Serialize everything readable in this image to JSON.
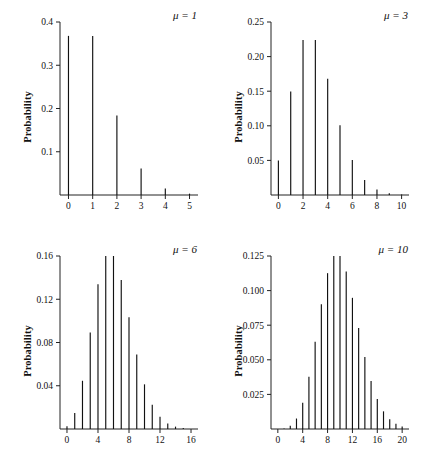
{
  "figure": {
    "title": "",
    "panel_count": 4
  },
  "chart_data": [
    {
      "type": "bar",
      "title": "",
      "annotation": "μ = 1",
      "mu": 1,
      "xlabel": "",
      "ylabel": "Probability",
      "x": [
        0,
        1,
        2,
        3,
        4,
        5
      ],
      "values": [
        0.3679,
        0.3679,
        0.1839,
        0.0613,
        0.0153,
        0.0031
      ],
      "categories": [
        "0",
        "1",
        "2",
        "3",
        "4",
        "5"
      ],
      "xlim": [
        -0.35,
        5.35
      ],
      "ylim": [
        0,
        0.4
      ],
      "xticks": [
        0,
        1,
        2,
        3,
        4,
        5
      ],
      "xticklabels": [
        "0",
        "1",
        "2",
        "3",
        "4",
        "5"
      ],
      "yticks": [
        0.1,
        0.2,
        0.3,
        0.4
      ],
      "yticklabels": [
        "0.1",
        "0.2",
        "0.3",
        "0.4"
      ],
      "grid": false,
      "legend": "none"
    },
    {
      "type": "bar",
      "title": "",
      "annotation": "μ = 3",
      "mu": 3,
      "xlabel": "",
      "ylabel": "Probability",
      "x": [
        0,
        1,
        2,
        3,
        4,
        5,
        6,
        7,
        8,
        9,
        10
      ],
      "values": [
        0.0498,
        0.1494,
        0.224,
        0.224,
        0.168,
        0.1008,
        0.0504,
        0.0216,
        0.0081,
        0.0027,
        0.0008
      ],
      "categories": [
        "0",
        "1",
        "2",
        "3",
        "4",
        "5",
        "6",
        "7",
        "8",
        "9",
        "10"
      ],
      "xlim": [
        -0.6,
        10.6
      ],
      "ylim": [
        0,
        0.25
      ],
      "xticks": [
        0,
        2,
        4,
        6,
        8,
        10
      ],
      "xticklabels": [
        "0",
        "2",
        "4",
        "6",
        "8",
        "10"
      ],
      "yticks": [
        0.05,
        0.1,
        0.15,
        0.2,
        0.25
      ],
      "yticklabels": [
        "0.05",
        "0.10",
        "0.15",
        "0.20",
        "0.25"
      ],
      "grid": false,
      "legend": "none"
    },
    {
      "type": "bar",
      "title": "",
      "annotation": "μ = 6",
      "mu": 6,
      "xlabel": "",
      "ylabel": "Probability",
      "x": [
        0,
        1,
        2,
        3,
        4,
        5,
        6,
        7,
        8,
        9,
        10,
        11,
        12,
        13,
        14,
        15,
        16
      ],
      "values": [
        0.0025,
        0.0149,
        0.0446,
        0.0892,
        0.1339,
        0.1606,
        0.1606,
        0.1377,
        0.1033,
        0.0688,
        0.0413,
        0.0225,
        0.0113,
        0.0052,
        0.0022,
        0.0009,
        0.0003
      ],
      "categories": [
        "0",
        "1",
        "2",
        "3",
        "4",
        "5",
        "6",
        "7",
        "8",
        "9",
        "10",
        "11",
        "12",
        "13",
        "14",
        "15",
        "16"
      ],
      "xlim": [
        -0.9,
        16.9
      ],
      "ylim": [
        0,
        0.16
      ],
      "xticks": [
        0,
        4,
        8,
        12,
        16
      ],
      "xticklabels": [
        "0",
        "4",
        "8",
        "12",
        "16"
      ],
      "yticks": [
        0.04,
        0.08,
        0.12,
        0.16
      ],
      "yticklabels": [
        "0.04",
        "0.08",
        "0.12",
        "0.16"
      ],
      "grid": false,
      "legend": "none"
    },
    {
      "type": "bar",
      "title": "",
      "annotation": "μ = 10",
      "mu": 10,
      "xlabel": "",
      "ylabel": "Probability",
      "x": [
        0,
        1,
        2,
        3,
        4,
        5,
        6,
        7,
        8,
        9,
        10,
        11,
        12,
        13,
        14,
        15,
        16,
        17,
        18,
        19,
        20
      ],
      "values": [
        5e-05,
        0.00045,
        0.00227,
        0.00757,
        0.01892,
        0.03783,
        0.06306,
        0.09008,
        0.1126,
        0.12511,
        0.12511,
        0.11374,
        0.09478,
        0.07291,
        0.05208,
        0.03472,
        0.0217,
        0.01276,
        0.00709,
        0.00373,
        0.00187
      ],
      "categories": [
        "0",
        "1",
        "2",
        "3",
        "4",
        "5",
        "6",
        "7",
        "8",
        "9",
        "10",
        "11",
        "12",
        "13",
        "14",
        "15",
        "16",
        "17",
        "18",
        "19",
        "20"
      ],
      "xlim": [
        -1.1,
        21.1
      ],
      "ylim": [
        0,
        0.125
      ],
      "xticks": [
        0,
        4,
        8,
        12,
        16,
        20
      ],
      "xticklabels": [
        "0",
        "4",
        "8",
        "12",
        "16",
        "20"
      ],
      "yticks": [
        0.025,
        0.05,
        0.075,
        0.1,
        0.125
      ],
      "yticklabels": [
        "0.025",
        "0.050",
        "0.075",
        "0.100",
        "0.125"
      ],
      "grid": false,
      "legend": "none"
    }
  ]
}
